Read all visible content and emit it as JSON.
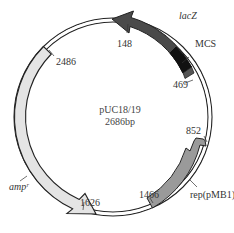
{
  "plasmid": {
    "name": "pUC18/19",
    "size_label": "2686bp"
  },
  "features": [
    {
      "id": "lacZ",
      "label": "lacZ",
      "color": "#4a4a4a",
      "direction": "counterclockwise"
    },
    {
      "id": "mcs",
      "label": "MCS",
      "color": "#111111"
    },
    {
      "id": "rep",
      "label": "rep(pMB1)",
      "color": "#9a9a9a",
      "direction": "counterclockwise"
    },
    {
      "id": "amp",
      "label": "ampʳ",
      "color": "#e4e4e4",
      "direction": "counterclockwise"
    }
  ],
  "positions": {
    "p148": "148",
    "p469": "469",
    "p852": "852",
    "p1466": "1466",
    "p1626": "1626",
    "p2486": "2486"
  },
  "colors": {
    "backbone": "#222222",
    "lacZ": "#4a4a4a",
    "mcs": "#111111",
    "rep": "#9a9a9a",
    "amp": "#e4e4e4"
  }
}
